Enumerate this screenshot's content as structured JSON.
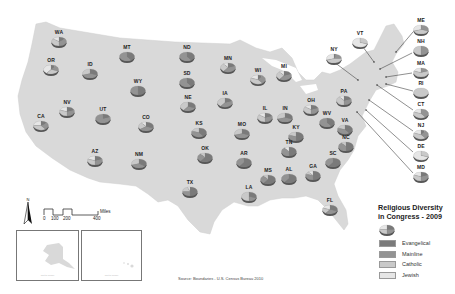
{
  "map": {
    "legend": {
      "title_line1": "Religious Diversity",
      "title_line2": "in Congress - 2009",
      "items": [
        {
          "label": "Evangelical",
          "color": "#7a7a7a"
        },
        {
          "label": "Mainline",
          "color": "#939393"
        },
        {
          "label": "Catholic",
          "color": "#c9c9c9"
        },
        {
          "label": "Jewish",
          "color": "#e6e6e6"
        }
      ]
    },
    "scale_bar": {
      "unit": "Miles",
      "ticks": [
        "0",
        "100",
        "200",
        "400"
      ]
    },
    "north_arrow_label": "N",
    "source": "Source: Boundaries - U.S. Census Bureau 2010",
    "insets": [
      {
        "state": "AK",
        "note": "Not to Scale"
      },
      {
        "state": "HI",
        "note": "Not to Scale"
      }
    ],
    "colors": {
      "land": "#d9d9d9",
      "evangelical": "#7a7a7a",
      "mainline": "#939393",
      "catholic": "#c9c9c9",
      "jewish": "#e6e6e6"
    },
    "states": [
      {
        "code": "WA",
        "x": 59,
        "y": 40,
        "ev": 0.15,
        "ml": 0.35,
        "ca": 0.35,
        "je": 0.15
      },
      {
        "code": "OR",
        "x": 51,
        "y": 68,
        "ev": 0.1,
        "ml": 0.2,
        "ca": 0.3,
        "je": 0.4
      },
      {
        "code": "ID",
        "x": 90,
        "y": 72,
        "ev": 0.3,
        "ml": 0.4,
        "ca": 0.3,
        "je": 0.0
      },
      {
        "code": "MT",
        "x": 127,
        "y": 55,
        "ev": 0.4,
        "ml": 0.6,
        "ca": 0.0,
        "je": 0.0
      },
      {
        "code": "WY",
        "x": 138,
        "y": 89,
        "ev": 0.5,
        "ml": 0.5,
        "ca": 0.0,
        "je": 0.0
      },
      {
        "code": "NV",
        "x": 67,
        "y": 110,
        "ev": 0.2,
        "ml": 0.3,
        "ca": 0.3,
        "je": 0.2
      },
      {
        "code": "UT",
        "x": 103,
        "y": 117,
        "ev": 0.2,
        "ml": 0.8,
        "ca": 0.0,
        "je": 0.0
      },
      {
        "code": "CA",
        "x": 41,
        "y": 124,
        "ev": 0.15,
        "ml": 0.25,
        "ca": 0.35,
        "je": 0.25
      },
      {
        "code": "CO",
        "x": 146,
        "y": 125,
        "ev": 0.3,
        "ml": 0.35,
        "ca": 0.25,
        "je": 0.1
      },
      {
        "code": "AZ",
        "x": 95,
        "y": 159,
        "ev": 0.2,
        "ml": 0.3,
        "ca": 0.3,
        "je": 0.2
      },
      {
        "code": "NM",
        "x": 139,
        "y": 162,
        "ev": 0.35,
        "ml": 0.35,
        "ca": 0.3,
        "je": 0.0
      },
      {
        "code": "ND",
        "x": 187,
        "y": 55,
        "ev": 0.4,
        "ml": 0.6,
        "ca": 0.0,
        "je": 0.0
      },
      {
        "code": "SD",
        "x": 187,
        "y": 81,
        "ev": 0.4,
        "ml": 0.6,
        "ca": 0.0,
        "je": 0.0
      },
      {
        "code": "NE",
        "x": 188,
        "y": 105,
        "ev": 0.3,
        "ml": 0.3,
        "ca": 0.4,
        "je": 0.0
      },
      {
        "code": "KS",
        "x": 199,
        "y": 131,
        "ev": 0.4,
        "ml": 0.4,
        "ca": 0.2,
        "je": 0.0
      },
      {
        "code": "OK",
        "x": 205,
        "y": 156,
        "ev": 0.6,
        "ml": 0.3,
        "ca": 0.1,
        "je": 0.0
      },
      {
        "code": "TX",
        "x": 190,
        "y": 190,
        "ev": 0.5,
        "ml": 0.25,
        "ca": 0.2,
        "je": 0.05
      },
      {
        "code": "MN",
        "x": 228,
        "y": 66,
        "ev": 0.2,
        "ml": 0.4,
        "ca": 0.3,
        "je": 0.1
      },
      {
        "code": "IA",
        "x": 225,
        "y": 101,
        "ev": 0.2,
        "ml": 0.4,
        "ca": 0.4,
        "je": 0.0
      },
      {
        "code": "MO",
        "x": 242,
        "y": 132,
        "ev": 0.3,
        "ml": 0.4,
        "ca": 0.3,
        "je": 0.0
      },
      {
        "code": "AR",
        "x": 244,
        "y": 161,
        "ev": 0.6,
        "ml": 0.4,
        "ca": 0.0,
        "je": 0.0
      },
      {
        "code": "LA",
        "x": 249,
        "y": 195,
        "ev": 0.3,
        "ml": 0.2,
        "ca": 0.5,
        "je": 0.0
      },
      {
        "code": "WI",
        "x": 258,
        "y": 78,
        "ev": 0.1,
        "ml": 0.3,
        "ca": 0.4,
        "je": 0.2
      },
      {
        "code": "MI",
        "x": 284,
        "y": 74,
        "ev": 0.2,
        "ml": 0.4,
        "ca": 0.3,
        "je": 0.1
      },
      {
        "code": "IL",
        "x": 265,
        "y": 116,
        "ev": 0.2,
        "ml": 0.3,
        "ca": 0.35,
        "je": 0.15
      },
      {
        "code": "IN",
        "x": 285,
        "y": 116,
        "ev": 0.3,
        "ml": 0.4,
        "ca": 0.3,
        "je": 0.0
      },
      {
        "code": "KY",
        "x": 296,
        "y": 135,
        "ev": 0.5,
        "ml": 0.3,
        "ca": 0.2,
        "je": 0.0
      },
      {
        "code": "TN",
        "x": 289,
        "y": 150,
        "ev": 0.5,
        "ml": 0.4,
        "ca": 0.0,
        "je": 0.1
      },
      {
        "code": "MS",
        "x": 268,
        "y": 178,
        "ev": 0.6,
        "ml": 0.3,
        "ca": 0.1,
        "je": 0.0
      },
      {
        "code": "AL",
        "x": 289,
        "y": 177,
        "ev": 0.6,
        "ml": 0.4,
        "ca": 0.0,
        "je": 0.0
      },
      {
        "code": "OH",
        "x": 311,
        "y": 108,
        "ev": 0.2,
        "ml": 0.3,
        "ca": 0.35,
        "je": 0.15
      },
      {
        "code": "WV",
        "x": 327,
        "y": 121,
        "ev": 0.4,
        "ml": 0.6,
        "ca": 0.0,
        "je": 0.0
      },
      {
        "code": "VA",
        "x": 345,
        "y": 128,
        "ev": 0.4,
        "ml": 0.4,
        "ca": 0.2,
        "je": 0.0
      },
      {
        "code": "NC",
        "x": 346,
        "y": 145,
        "ev": 0.5,
        "ml": 0.4,
        "ca": 0.1,
        "je": 0.0
      },
      {
        "code": "SC",
        "x": 333,
        "y": 161,
        "ev": 0.6,
        "ml": 0.4,
        "ca": 0.0,
        "je": 0.0
      },
      {
        "code": "GA",
        "x": 313,
        "y": 174,
        "ev": 0.5,
        "ml": 0.3,
        "ca": 0.1,
        "je": 0.1
      },
      {
        "code": "FL",
        "x": 330,
        "y": 208,
        "ev": 0.3,
        "ml": 0.3,
        "ca": 0.2,
        "je": 0.2
      },
      {
        "code": "PA",
        "x": 344,
        "y": 99,
        "ev": 0.2,
        "ml": 0.3,
        "ca": 0.4,
        "je": 0.1
      },
      {
        "code": "NY",
        "x": 334,
        "y": 57,
        "ev": 0.05,
        "ml": 0.2,
        "ca": 0.45,
        "je": 0.3
      },
      {
        "code": "VT",
        "x": 360,
        "y": 41,
        "ev": 0.0,
        "ml": 0.0,
        "ca": 0.3,
        "je": 0.7
      },
      {
        "code": "ME",
        "x": 421,
        "y": 28,
        "ev": 0.0,
        "ml": 0.3,
        "ca": 0.4,
        "je": 0.3
      },
      {
        "code": "NH",
        "x": 421,
        "y": 49,
        "ev": 0.0,
        "ml": 0.5,
        "ca": 0.5,
        "je": 0.0
      },
      {
        "code": "MA",
        "x": 421,
        "y": 71,
        "ev": 0.0,
        "ml": 0.2,
        "ca": 0.6,
        "je": 0.2
      },
      {
        "code": "RI",
        "x": 421,
        "y": 91,
        "ev": 0.0,
        "ml": 0.0,
        "ca": 1.0,
        "je": 0.0
      },
      {
        "code": "CT",
        "x": 421,
        "y": 112,
        "ev": 0.0,
        "ml": 0.4,
        "ca": 0.4,
        "je": 0.2
      },
      {
        "code": "NJ",
        "x": 421,
        "y": 133,
        "ev": 0.1,
        "ml": 0.3,
        "ca": 0.4,
        "je": 0.2
      },
      {
        "code": "DE",
        "x": 421,
        "y": 154,
        "ev": 0.0,
        "ml": 0.0,
        "ca": 0.3,
        "je": 0.7
      },
      {
        "code": "MD",
        "x": 421,
        "y": 175,
        "ev": 0.2,
        "ml": 0.3,
        "ca": 0.3,
        "je": 0.2
      }
    ],
    "leaders": [
      {
        "code": "NY",
        "x1": 334,
        "y1": 62,
        "x2": 358,
        "y2": 80
      },
      {
        "code": "VT",
        "x1": 363,
        "y1": 47,
        "x2": 374,
        "y2": 62
      },
      {
        "code": "ME",
        "x1": 413,
        "y1": 32,
        "x2": 396,
        "y2": 52
      },
      {
        "code": "NH",
        "x1": 412,
        "y1": 53,
        "x2": 380,
        "y2": 69
      },
      {
        "code": "MA",
        "x1": 412,
        "y1": 73,
        "x2": 386,
        "y2": 77
      },
      {
        "code": "RI",
        "x1": 413,
        "y1": 91,
        "x2": 386,
        "y2": 84
      },
      {
        "code": "CT",
        "x1": 413,
        "y1": 110,
        "x2": 377,
        "y2": 85
      },
      {
        "code": "NJ",
        "x1": 413,
        "y1": 131,
        "x2": 369,
        "y2": 100
      },
      {
        "code": "DE",
        "x1": 413,
        "y1": 152,
        "x2": 366,
        "y2": 110
      },
      {
        "code": "MD",
        "x1": 413,
        "y1": 173,
        "x2": 357,
        "y2": 112
      }
    ],
    "inset_pies": [
      {
        "code": "AK",
        "x": 28,
        "y": 242,
        "ev": 0.2,
        "ml": 0.2,
        "ca": 0.3,
        "je": 0.3
      },
      {
        "code": "HI",
        "x": 128,
        "y": 241,
        "ev": 0.5,
        "ml": 0.5,
        "ca": 0.0,
        "je": 0.0
      }
    ],
    "legend_pie": {
      "x": 387,
      "y": 228,
      "ev": 0.25,
      "ml": 0.25,
      "ca": 0.25,
      "je": 0.25
    }
  },
  "chart_data": {
    "type": "pie-map",
    "title": "Religious Diversity in Congress - 2009",
    "categories": [
      "Evangelical",
      "Mainline",
      "Catholic",
      "Jewish"
    ],
    "states": [
      "WA",
      "OR",
      "ID",
      "MT",
      "WY",
      "NV",
      "UT",
      "CA",
      "CO",
      "AZ",
      "NM",
      "ND",
      "SD",
      "NE",
      "KS",
      "OK",
      "TX",
      "MN",
      "IA",
      "MO",
      "AR",
      "LA",
      "WI",
      "MI",
      "IL",
      "IN",
      "KY",
      "TN",
      "MS",
      "AL",
      "OH",
      "WV",
      "VA",
      "NC",
      "SC",
      "GA",
      "FL",
      "PA",
      "NY",
      "VT",
      "ME",
      "NH",
      "MA",
      "RI",
      "CT",
      "NJ",
      "DE",
      "MD",
      "AK",
      "HI"
    ],
    "source": "Source: Boundaries - U.S. Census Bureau 2010"
  }
}
